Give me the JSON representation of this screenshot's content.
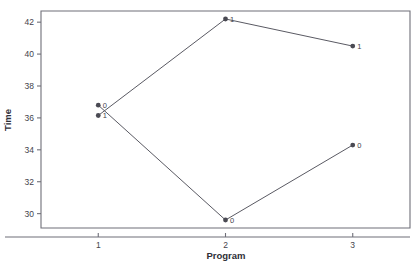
{
  "chart_data": {
    "type": "line",
    "title": "",
    "subtitle": "",
    "xlabel": "Program",
    "ylabel": "Time",
    "x": [
      1,
      2,
      3
    ],
    "xticklabels": [
      "1",
      "2",
      "3"
    ],
    "yticklabels": [
      "30",
      "32",
      "34",
      "36",
      "38",
      "40",
      "42"
    ],
    "yticks": [
      30,
      32,
      34,
      36,
      38,
      40,
      42
    ],
    "xlim": [
      0.55,
      3.45
    ],
    "ylim": [
      29.1,
      42.7
    ],
    "grid": false,
    "legend": false,
    "legend_position": "none",
    "marker": "filled-circle",
    "series": [
      {
        "name": "0",
        "label": "0",
        "values": [
          36.8,
          29.6,
          34.3
        ],
        "point_labels": [
          "0",
          "0",
          "0"
        ]
      },
      {
        "name": "1",
        "label": "1",
        "values": [
          36.15,
          42.2,
          40.5
        ],
        "point_labels": [
          "1",
          "1",
          "1"
        ]
      }
    ],
    "annotations": [
      {
        "text": "0",
        "x": 1,
        "y": 36.8
      },
      {
        "text": "1",
        "x": 1,
        "y": 36.15
      },
      {
        "text": "1",
        "x": 2,
        "y": 42.2
      },
      {
        "text": "0",
        "x": 2,
        "y": 29.6
      },
      {
        "text": "1",
        "x": 3,
        "y": 40.5
      },
      {
        "text": "0",
        "x": 3,
        "y": 34.3
      }
    ],
    "colors": {
      "line": "#5a5a63",
      "marker": "#4a4a53",
      "axis": "#6f6f78",
      "text": "#44444c",
      "background": "#ffffff"
    }
  }
}
